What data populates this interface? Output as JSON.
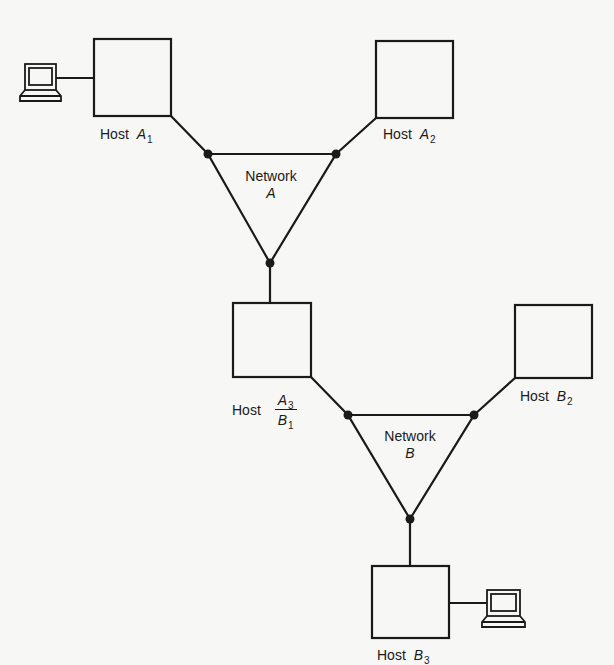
{
  "diagram": {
    "type": "network-topology",
    "hosts": [
      {
        "id": "A1",
        "word": "Host",
        "letter": "A",
        "sub": "1",
        "has_terminal": true
      },
      {
        "id": "A2",
        "word": "Host",
        "letter": "A",
        "sub": "2",
        "has_terminal": false
      },
      {
        "id": "A3B1",
        "word": "Host",
        "top_letter": "A",
        "top_sub": "3",
        "bottom_letter": "B",
        "bottom_sub": "1",
        "has_terminal": false
      },
      {
        "id": "B2",
        "word": "Host",
        "letter": "B",
        "sub": "2",
        "has_terminal": false
      },
      {
        "id": "B3",
        "word": "Host",
        "letter": "B",
        "sub": "3",
        "has_terminal": true
      }
    ],
    "networks": [
      {
        "id": "A",
        "word": "Network",
        "letter": "A",
        "connected_hosts": [
          "A1",
          "A2",
          "A3B1"
        ]
      },
      {
        "id": "B",
        "word": "Network",
        "letter": "B",
        "connected_hosts": [
          "A3B1",
          "B2",
          "B3"
        ]
      }
    ],
    "terminals": [
      {
        "id": "terminal-A1",
        "attached_to": "A1",
        "icon": "terminal-icon"
      },
      {
        "id": "terminal-B3",
        "attached_to": "B3",
        "icon": "terminal-icon"
      }
    ],
    "colors": {
      "ink": "#1a1a1a",
      "paper": "#f7f7f5"
    }
  }
}
